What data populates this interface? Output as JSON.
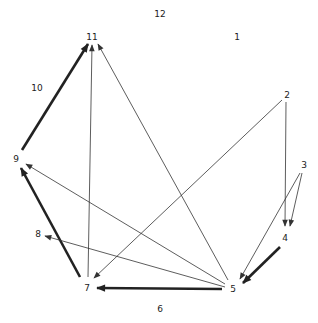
{
  "diagram": {
    "type": "directed-graph",
    "nodes": [
      {
        "id": "12",
        "label": "12",
        "x": 160,
        "y": 14
      },
      {
        "id": "1",
        "label": "1",
        "x": 237,
        "y": 37
      },
      {
        "id": "2",
        "label": "2",
        "x": 287,
        "y": 95
      },
      {
        "id": "3",
        "label": "3",
        "x": 304,
        "y": 165
      },
      {
        "id": "4",
        "label": "4",
        "x": 285,
        "y": 238
      },
      {
        "id": "5",
        "label": "5",
        "x": 233,
        "y": 289
      },
      {
        "id": "6",
        "label": "6",
        "x": 160,
        "y": 309
      },
      {
        "id": "7",
        "label": "7",
        "x": 87,
        "y": 288
      },
      {
        "id": "8",
        "label": "8",
        "x": 38,
        "y": 234
      },
      {
        "id": "9",
        "label": "9",
        "x": 16,
        "y": 159
      },
      {
        "id": "10",
        "label": "10",
        "x": 37,
        "y": 88
      },
      {
        "id": "11",
        "label": "11",
        "x": 92,
        "y": 37
      }
    ],
    "edges": [
      {
        "from": "9",
        "to": "11",
        "weight": "thick",
        "x1": 22,
        "y1": 150,
        "x2": 88,
        "y2": 44
      },
      {
        "from": "7",
        "to": "11",
        "weight": "thin",
        "x1": 88,
        "y1": 277,
        "x2": 92,
        "y2": 45
      },
      {
        "from": "5",
        "to": "11",
        "weight": "thin",
        "x1": 228,
        "y1": 280,
        "x2": 98,
        "y2": 44
      },
      {
        "from": "2",
        "to": "7",
        "weight": "thin",
        "x1": 282,
        "y1": 100,
        "x2": 94,
        "y2": 278
      },
      {
        "from": "2",
        "to": "4",
        "weight": "thin",
        "x1": 286,
        "y1": 102,
        "x2": 285,
        "y2": 226
      },
      {
        "from": "3",
        "to": "4",
        "weight": "thin",
        "x1": 302,
        "y1": 173,
        "x2": 290,
        "y2": 226
      },
      {
        "from": "3",
        "to": "5",
        "weight": "thin",
        "x1": 300,
        "y1": 173,
        "x2": 240,
        "y2": 279
      },
      {
        "from": "4",
        "to": "5",
        "weight": "thick",
        "x1": 280,
        "y1": 247,
        "x2": 243,
        "y2": 283
      },
      {
        "from": "5",
        "to": "7",
        "weight": "thick",
        "x1": 222,
        "y1": 289,
        "x2": 97,
        "y2": 288
      },
      {
        "from": "7",
        "to": "9",
        "weight": "thick",
        "x1": 80,
        "y1": 277,
        "x2": 21,
        "y2": 168
      },
      {
        "from": "5",
        "to": "9",
        "weight": "thin",
        "x1": 225,
        "y1": 284,
        "x2": 26,
        "y2": 164
      },
      {
        "from": "5",
        "to": "8",
        "weight": "thin",
        "x1": 225,
        "y1": 287,
        "x2": 45,
        "y2": 236
      }
    ]
  }
}
